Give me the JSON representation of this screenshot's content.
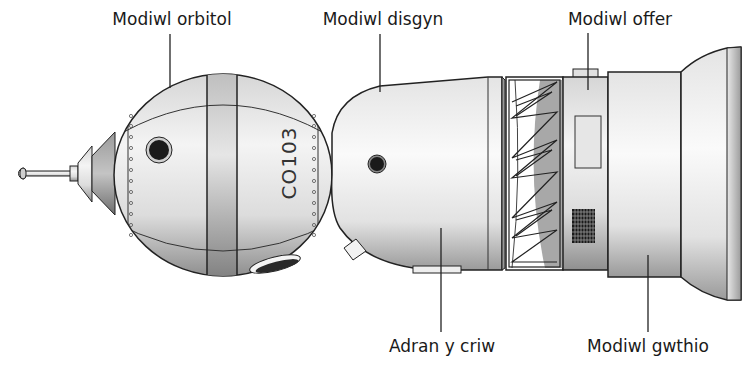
{
  "diagram": {
    "labels": {
      "orbital_module": "Modiwl orbitol",
      "descent_module": "Modiwl disgyn",
      "instrument_module": "Modiwl offer",
      "crew_section": "Adran y criw",
      "propulsion_module": "Modiwl gwthio"
    },
    "hull_marking": "CO103",
    "colors": {
      "outline": "#222222",
      "hull_light": "#f2f2f2",
      "hull_mid": "#c8c8c8",
      "hull_dark": "#8a8a8a",
      "window": "#1a1a1a",
      "text": "#1a1a1a",
      "background": "#ffffff"
    }
  }
}
